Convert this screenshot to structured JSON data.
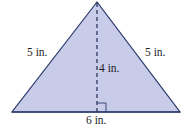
{
  "figure": {
    "shape": "isosceles-triangle",
    "fill_color": "#c9cce9",
    "stroke_color": "#2b3a6b",
    "labels": {
      "left_side": "5 in.",
      "right_side": "5 in.",
      "height": "4 in.",
      "base": "6 in."
    }
  }
}
